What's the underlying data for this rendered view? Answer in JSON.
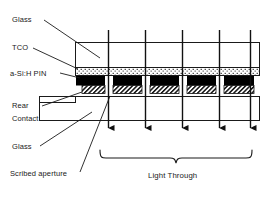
{
  "figure": {
    "type": "cross-section-schematic",
    "labels": {
      "glass_top": "Glass",
      "tco": "TCO",
      "asi_pin": "a-Si:H PIN",
      "rear": "Rear",
      "contact": "Contact",
      "glass_bottom": "Glass",
      "scribed_aperture": "Scribed aperture",
      "light_through": "Light Through"
    },
    "layers": [
      {
        "name": "glass-top",
        "label": "Glass",
        "fill": "#ffffff",
        "pattern": "none"
      },
      {
        "name": "tco",
        "label": "TCO",
        "fill": "#ffffff",
        "pattern": "dotted"
      },
      {
        "name": "asi-h-pin",
        "label": "a-Si:H PIN",
        "fill": "#000000",
        "pattern": "solid"
      },
      {
        "name": "rear-contact",
        "label": "Rear Contact",
        "fill": "#ffffff",
        "pattern": "diagonal-hatch"
      },
      {
        "name": "glass-bottom",
        "label": "Glass",
        "fill": "#ffffff",
        "pattern": "none"
      }
    ],
    "cells": 5,
    "apertures": 4,
    "light_rays": 5,
    "colors": {
      "stroke": "#1a1a1a",
      "text": "#1a1a1a",
      "background": "#ffffff",
      "absorber": "#000000"
    }
  }
}
